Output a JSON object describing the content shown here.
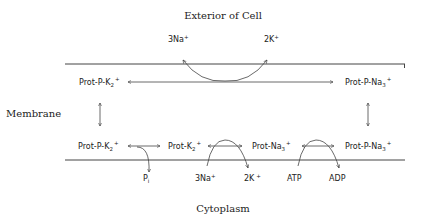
{
  "diagram": {
    "title_top": "Exterior of Cell",
    "title_bottom": "Cytoplasm",
    "side_label": "Membrane",
    "exterior_ions": {
      "left": {
        "base": "3Na",
        "sup": "+"
      },
      "right": {
        "base": "2K",
        "sup": "+"
      }
    },
    "top_row": {
      "left": {
        "base": "Prot-P-K",
        "sub": "2",
        "sup": "+"
      },
      "right": {
        "base": "Prot-P-Na",
        "sub": "3",
        "sup": "+"
      }
    },
    "bottom_row": [
      {
        "base": "Prot-P-K",
        "sub": "2",
        "sup": "+"
      },
      {
        "base": "Prot-K",
        "sub": "2",
        "sup": "+"
      },
      {
        "base": "Prot-Na",
        "sub": "3",
        "sup": "+"
      },
      {
        "base": "Prot-P-Na",
        "sub": "3",
        "sup": "+"
      }
    ],
    "cytoplasm_labels": {
      "pi": {
        "base": "P",
        "sub": "i"
      },
      "na": {
        "base": "3Na",
        "sup": "+"
      },
      "k": {
        "base": "2K",
        "sup": "+"
      },
      "atp": "ATP",
      "adp": "ADP"
    }
  }
}
